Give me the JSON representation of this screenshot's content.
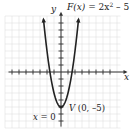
{
  "chart_data": {
    "type": "line",
    "function_label": {
      "name": "F(x)",
      "equals": "= 2x",
      "exp": "2",
      "tail": " – 5"
    },
    "xlabel": "x",
    "ylabel": "y",
    "xlim": [
      -8,
      9
    ],
    "ylim": [
      -8,
      8
    ],
    "grid": true,
    "x_ticks": [
      -7,
      -6,
      -5,
      -4,
      -3,
      -2,
      -1,
      1,
      2,
      3,
      4,
      5,
      6,
      7
    ],
    "y_ticks": [
      -7,
      -6,
      -5,
      -4,
      -3,
      -2,
      -1,
      1,
      2,
      3,
      4,
      5,
      6,
      7
    ],
    "series": [
      {
        "name": "F(x) = 2x^2 - 5",
        "x": [
          -2.55,
          -2,
          -1.5,
          -1,
          -0.5,
          0,
          0.5,
          1,
          1.5,
          2,
          2.55
        ],
        "y": [
          8,
          3,
          -0.5,
          -3,
          -4.5,
          -5,
          -4.5,
          -3,
          -0.5,
          3,
          8
        ]
      }
    ],
    "annotations": [
      {
        "text": "V (0, –5)",
        "x": 0,
        "y": -5,
        "meaning": "vertex"
      },
      {
        "text": "x = 0",
        "meaning": "axis of symmetry"
      }
    ]
  },
  "labels": {
    "y_axis": "y",
    "x_axis": "x",
    "func_name": "F(x)",
    "func_eq": " = 2x",
    "func_exp": "2",
    "func_tail": " – 5",
    "vertex_V": "V",
    "vertex_coords": " (0, –5)",
    "axis_sym_x": "x",
    "axis_sym_eq": " = 0"
  },
  "colors": {
    "curve": "#222222",
    "axis": "#333333",
    "grid": "#d8d8d8"
  }
}
